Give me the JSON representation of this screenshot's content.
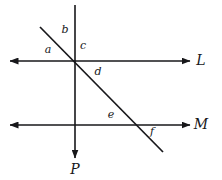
{
  "figure": {
    "background_color": "#ffffff",
    "stroke_color": "#17171a",
    "width": 222,
    "height": 180
  },
  "lines": [
    {
      "id": "line-L",
      "label": "L",
      "kind": "horizontal",
      "label_x": 201,
      "label_y": 60,
      "x1": 10,
      "y1": 61,
      "x2": 190,
      "y2": 61,
      "arrow_start": true,
      "arrow_end": true
    },
    {
      "id": "line-M",
      "label": "M",
      "kind": "horizontal",
      "label_x": 201,
      "label_y": 124,
      "x1": 10,
      "y1": 125,
      "x2": 190,
      "y2": 125,
      "arrow_start": true,
      "arrow_end": true
    },
    {
      "id": "line-P",
      "label": "P",
      "kind": "vertical",
      "label_x": 75,
      "label_y": 169,
      "x1": 75,
      "y1": 5,
      "x2": 75,
      "y2": 158,
      "arrow_start": false,
      "arrow_end": true
    },
    {
      "id": "transversal",
      "label": "",
      "kind": "diagonal",
      "label_x": 0,
      "label_y": 0,
      "x1": 40,
      "y1": 27,
      "x2": 163,
      "y2": 152,
      "arrow_start": false,
      "arrow_end": false
    }
  ],
  "angles": [
    {
      "id": "angle-a",
      "label": "a",
      "x": 48,
      "y": 49
    },
    {
      "id": "angle-b",
      "label": "b",
      "x": 65,
      "y": 29
    },
    {
      "id": "angle-c",
      "label": "c",
      "x": 83,
      "y": 45
    },
    {
      "id": "angle-d",
      "label": "d",
      "x": 98,
      "y": 71
    },
    {
      "id": "angle-e",
      "label": "e",
      "x": 111,
      "y": 114
    },
    {
      "id": "angle-f",
      "label": "f",
      "x": 152,
      "y": 131
    }
  ]
}
